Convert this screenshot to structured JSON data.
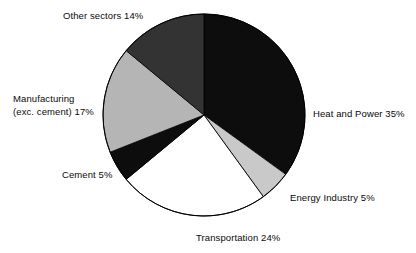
{
  "chart_data": {
    "type": "pie",
    "title": "",
    "subtitle": "",
    "xlabel": "",
    "ylabel": "",
    "legend_position": "none",
    "grid": false,
    "units": "percent",
    "start_angle_deg": 90,
    "direction": "clockwise",
    "categories": [
      "Heat and Power",
      "Energy Industry",
      "Transportation",
      "Cement",
      "Manufacturing (exc. cement)",
      "Other sectors"
    ],
    "values": [
      35,
      5,
      24,
      5,
      17,
      14
    ],
    "slice_colors": [
      "#0d0d0d",
      "#c9c9c9",
      "#ffffff",
      "#0d0d0d",
      "#b5b5b5",
      "#333333"
    ],
    "slices": [
      {
        "label": "Heat and Power",
        "value": 35,
        "value_text": "35%",
        "color": "#0d0d0d"
      },
      {
        "label": "Energy Industry",
        "value": 5,
        "value_text": "5%",
        "color": "#c9c9c9"
      },
      {
        "label": "Transportation",
        "value": 24,
        "value_text": "24%",
        "color": "#ffffff"
      },
      {
        "label": "Cement",
        "value": 5,
        "value_text": "5%",
        "color": "#0d0d0d"
      },
      {
        "label": "Manufacturing (exc. cement)",
        "value": 17,
        "value_text": "17%",
        "color": "#b5b5b5"
      },
      {
        "label": "Other sectors",
        "value": 14,
        "value_text": "14%",
        "color": "#333333"
      }
    ]
  },
  "labels": {
    "other_sectors": "Other sectors 14%",
    "heat_and_power": "Heat and Power 35%",
    "energy_industry": "Energy Industry 5%",
    "transportation": "Transportation 24%",
    "cement": "Cement 5%",
    "manufacturing_line1": "Manufacturing",
    "manufacturing_line2": "(exc. cement) 17%"
  },
  "colors": {
    "background": "#ffffff",
    "text": "#0a0a0a",
    "outline": "#000000"
  }
}
